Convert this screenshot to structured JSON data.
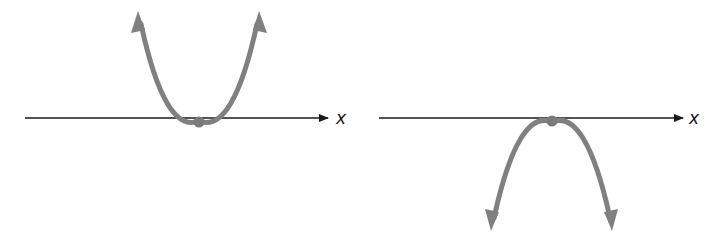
{
  "colors": {
    "axis": "#1a1a1a",
    "curve": "#808080",
    "vertex": "#7a7a7a",
    "background": "#ffffff"
  },
  "panels": [
    {
      "name": "upward-parabola",
      "axis_label": "x",
      "opens": "up",
      "vertex_on_axis": true
    },
    {
      "name": "downward-parabola",
      "axis_label": "x",
      "opens": "down",
      "vertex_on_axis": true
    }
  ]
}
